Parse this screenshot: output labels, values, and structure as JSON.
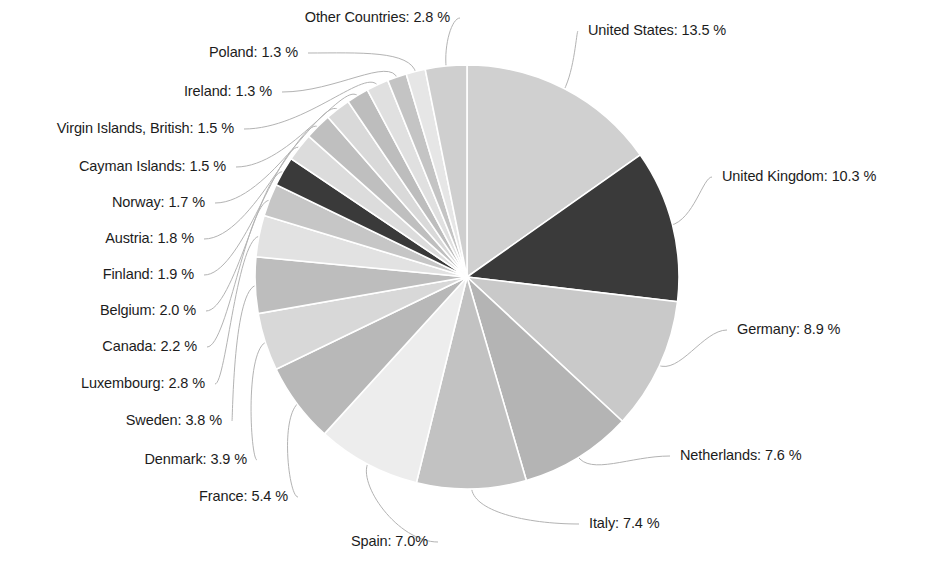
{
  "chart_data": {
    "type": "pie",
    "title": "",
    "subtitle": "",
    "xlabel": "",
    "ylabel": "",
    "legend_position": "none",
    "grid": false,
    "label_format": "{name}: {value} %",
    "units": "%",
    "categories": [
      "United States",
      "United Kingdom",
      "Germany",
      "Netherlands",
      "Italy",
      "Spain",
      "France",
      "Denmark",
      "Sweden",
      "Luxembourg",
      "Canada",
      "Belgium",
      "Finland",
      "Austria",
      "Norway",
      "Cayman Islands",
      "Virgin Islands, British",
      "Ireland",
      "Poland",
      "Other Countries"
    ],
    "values": [
      13.5,
      10.3,
      8.9,
      7.6,
      7.4,
      7.0,
      5.4,
      3.9,
      3.8,
      2.8,
      2.2,
      2.0,
      1.9,
      1.8,
      1.7,
      1.5,
      1.5,
      1.3,
      1.3,
      2.8
    ],
    "slice_colors": [
      "#d0d0d0",
      "#3a3a3a",
      "#c9c9c9",
      "#b4b4b4",
      "#c2c2c2",
      "#ededed",
      "#b8b8b8",
      "#d8d8d8",
      "#bdbdbd",
      "#e2e2e2",
      "#c6c6c6",
      "#3a3a3a",
      "#dcdcdc",
      "#bfbfbf",
      "#d9d9d9",
      "#bdbdbd",
      "#e0e0e0",
      "#c4c4c4",
      "#e6e6e6",
      "#cfcfcf"
    ],
    "start_angle_deg": 0,
    "direction": "clockwise",
    "leader_line_color": "#b3b3b3"
  },
  "labels": [
    {
      "id": "united-states",
      "text": "United States: 13.5 %",
      "side": "right",
      "x": 588,
      "y": 31
    },
    {
      "id": "united-kingdom",
      "text": "United Kingdom: 10.3 %",
      "side": "right",
      "x": 722,
      "y": 177
    },
    {
      "id": "germany",
      "text": "Germany: 8.9 %",
      "side": "right",
      "x": 737,
      "y": 330
    },
    {
      "id": "netherlands",
      "text": "Netherlands: 7.6 %",
      "side": "right",
      "x": 680,
      "y": 456
    },
    {
      "id": "italy",
      "text": "Italy: 7.4 %",
      "side": "right",
      "x": 589,
      "y": 524
    },
    {
      "id": "spain",
      "text": "Spain: 7.0%",
      "side": "left",
      "x": 428,
      "y": 542
    },
    {
      "id": "france",
      "text": "France: 5.4 %",
      "side": "left",
      "x": 288,
      "y": 497
    },
    {
      "id": "denmark",
      "text": "Denmark: 3.9 %",
      "side": "left",
      "x": 247,
      "y": 460
    },
    {
      "id": "sweden",
      "text": "Sweden: 3.8 %",
      "side": "left",
      "x": 222,
      "y": 421
    },
    {
      "id": "luxembourg",
      "text": "Luxembourg: 2.8 %",
      "side": "left",
      "x": 205,
      "y": 384
    },
    {
      "id": "canada",
      "text": "Canada: 2.2 %",
      "side": "left",
      "x": 197,
      "y": 347
    },
    {
      "id": "belgium",
      "text": "Belgium: 2.0 %",
      "side": "left",
      "x": 196,
      "y": 311
    },
    {
      "id": "finland",
      "text": "Finland: 1.9 %",
      "side": "left",
      "x": 194,
      "y": 275
    },
    {
      "id": "austria",
      "text": "Austria: 1.8 %",
      "side": "left",
      "x": 194,
      "y": 239
    },
    {
      "id": "norway",
      "text": "Norway: 1.7 %",
      "side": "left",
      "x": 205,
      "y": 203
    },
    {
      "id": "cayman-islands",
      "text": "Cayman Islands: 1.5 %",
      "side": "left",
      "x": 226,
      "y": 167
    },
    {
      "id": "virgin-islands-british",
      "text": "Virgin Islands, British: 1.5 %",
      "side": "left",
      "x": 234,
      "y": 129
    },
    {
      "id": "ireland",
      "text": "Ireland: 1.3 %",
      "side": "left",
      "x": 272,
      "y": 92
    },
    {
      "id": "poland",
      "text": "Poland: 1.3 %",
      "side": "left",
      "x": 298,
      "y": 53
    },
    {
      "id": "other-countries",
      "text": "Other Countries: 2.8 %",
      "side": "left",
      "x": 450,
      "y": 18
    }
  ]
}
